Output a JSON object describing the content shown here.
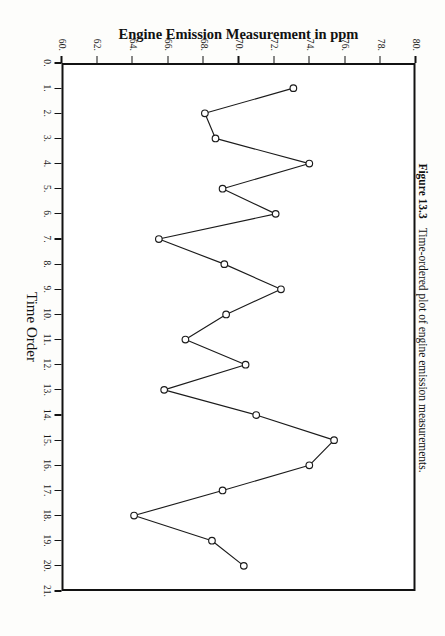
{
  "figure": {
    "caption_label": "Figure 13.3",
    "caption_text": "Time-ordered plot of engine emission measurements."
  },
  "chart_data": {
    "type": "line",
    "title": "",
    "xlabel": "Time Order",
    "ylabel": "Engine Emission Measurement in ppm",
    "xlim": [
      0,
      21
    ],
    "ylim": [
      60,
      80
    ],
    "grid": false,
    "legend": "none",
    "marker": "open-circle",
    "xticks": [
      "0.",
      "1.",
      "2.",
      "3.",
      "4.",
      "5.",
      "6.",
      "7.",
      "8.",
      "9.",
      "10.",
      "11.",
      "12.",
      "13.",
      "14.",
      "15.",
      "16.",
      "17.",
      "18.",
      "19.",
      "20.",
      "21."
    ],
    "xtick_values": [
      0,
      1,
      2,
      3,
      4,
      5,
      6,
      7,
      8,
      9,
      10,
      11,
      12,
      13,
      14,
      15,
      16,
      17,
      18,
      19,
      20,
      21
    ],
    "yticks": [
      "60.",
      "62.",
      "64.",
      "66.",
      "68.",
      "70.",
      "72.",
      "74.",
      "76.",
      "78.",
      "80."
    ],
    "ytick_values": [
      60,
      62,
      64,
      66,
      68,
      70,
      72,
      74,
      76,
      78,
      80
    ],
    "x": [
      1,
      2,
      3,
      4,
      5,
      6,
      7,
      8,
      9,
      10,
      11,
      12,
      13,
      14,
      15,
      16,
      17,
      18,
      19,
      20
    ],
    "y": [
      73.1,
      68.1,
      68.7,
      74.0,
      69.1,
      72.1,
      65.5,
      69.2,
      72.4,
      69.3,
      67.0,
      70.4,
      65.8,
      71.0,
      75.4,
      74.0,
      69.1,
      64.1,
      68.5,
      70.3
    ],
    "series": [
      {
        "name": "Engine emission",
        "values": [
          73.1,
          68.1,
          68.7,
          74.0,
          69.1,
          72.1,
          65.5,
          69.2,
          72.4,
          69.3,
          67.0,
          70.4,
          65.8,
          71.0,
          75.4,
          74.0,
          69.1,
          64.1,
          68.5,
          70.3
        ]
      }
    ]
  }
}
